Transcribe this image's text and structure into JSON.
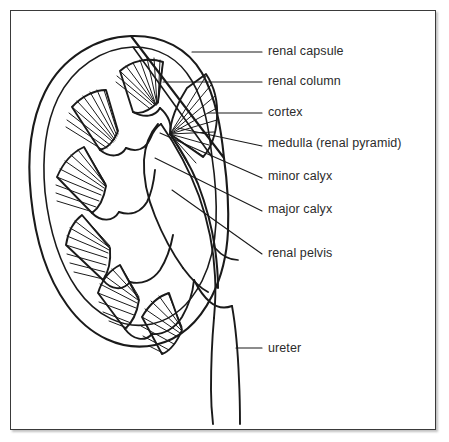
{
  "figure": {
    "type": "labeled-anatomical-diagram",
    "view": "frontal section",
    "frame": {
      "border_color": "#3a3a3a",
      "background_color": "#ffffff"
    },
    "style": {
      "line_color": "#1a1a1a",
      "text_color": "#2b2b2b",
      "fill": "none"
    }
  },
  "labels": [
    {
      "id": "renal-capsule",
      "text": "renal capsule",
      "x": 268,
      "y": 52,
      "leader": "horizontal"
    },
    {
      "id": "renal-column",
      "text": "renal column",
      "x": 268,
      "y": 82,
      "leader": "horizontal"
    },
    {
      "id": "cortex",
      "text": "cortex",
      "x": 268,
      "y": 113,
      "leader": "horizontal"
    },
    {
      "id": "medulla-renal-pyramid",
      "text": "medulla (renal pyramid)",
      "x": 268,
      "y": 143,
      "leader": "diagonal"
    },
    {
      "id": "minor-calyx",
      "text": "minor calyx",
      "x": 268,
      "y": 176,
      "leader": "diagonal"
    },
    {
      "id": "major-calyx",
      "text": "major calyx",
      "x": 268,
      "y": 209,
      "leader": "diagonal"
    },
    {
      "id": "renal-pelvis",
      "text": "renal pelvis",
      "x": 268,
      "y": 253,
      "leader": "diagonal"
    },
    {
      "id": "ureter",
      "text": "ureter",
      "x": 268,
      "y": 348,
      "leader": "horizontal"
    }
  ],
  "structures": {
    "renal_pyramids_count": 6,
    "calyx_lobes_count": 5,
    "ureter_tubes": 2
  }
}
